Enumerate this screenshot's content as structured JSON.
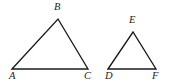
{
  "figure": {
    "type": "geometry-diagram",
    "background_color": "#ffffff",
    "stroke_color": "#1b1b1b",
    "label_color": "#1b1b1b",
    "canvas": {
      "width": 171,
      "height": 84
    }
  },
  "shapes": [
    {
      "name": "triangle-abc",
      "label": "Triangle ABC",
      "points": "12,69 58,19 88,69",
      "vertices": [
        {
          "id": "A",
          "label": "A",
          "x": 12,
          "y": 69
        },
        {
          "id": "B",
          "label": "B",
          "x": 58,
          "y": 19
        },
        {
          "id": "C",
          "label": "C",
          "x": 88,
          "y": 69
        }
      ]
    },
    {
      "name": "triangle-def",
      "label": "Triangle DEF",
      "points": "108,69 133,32 156,69",
      "vertices": [
        {
          "id": "D",
          "label": "D",
          "x": 108,
          "y": 69
        },
        {
          "id": "E",
          "label": "E",
          "x": 133,
          "y": 32
        },
        {
          "id": "F",
          "label": "F",
          "x": 156,
          "y": 69
        }
      ]
    }
  ],
  "labels": {
    "a": "A",
    "b": "B",
    "c": "C",
    "d": "D",
    "e": "E",
    "f": "F"
  }
}
